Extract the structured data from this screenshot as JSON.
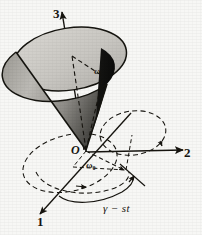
{
  "figure": {
    "background_color": "#f7f7f5",
    "ink_color": "#16140f"
  },
  "axes": [
    {
      "id": "axis-3",
      "label": "3",
      "direction": "up",
      "style": "solid-arrow"
    },
    {
      "id": "axis-2",
      "label": "2",
      "direction": "right",
      "style": "solid-arrow"
    },
    {
      "id": "axis-1",
      "label": "1",
      "direction": "down-left",
      "style": "solid-arrow"
    }
  ],
  "labels": {
    "origin": "O",
    "omega": "ω",
    "omega_zero_symbol": "ω",
    "omega_zero_subscript": "0",
    "angle_expression": "γ − st"
  },
  "cone": {
    "apex": "origin",
    "top_ellipse_fill": "#cfcdc8",
    "body_light_fill": "#a9a7a2",
    "body_dark_fill": "#1a1a1a",
    "outline_color": "#1a1a1a"
  },
  "curves": [
    {
      "id": "precession-circle-left",
      "style": "dashed",
      "has_arrow": true
    },
    {
      "id": "precession-circle-right",
      "style": "dashed",
      "has_arrow": true
    },
    {
      "id": "body-cone-base-circle",
      "style": "dashed",
      "has_arrow": true
    },
    {
      "id": "angle-arc",
      "style": "solid",
      "has_arrow": true
    }
  ],
  "vectors": [
    {
      "id": "omega-vector",
      "style": "dashed",
      "from": "origin",
      "to": "cone-top-rim"
    },
    {
      "id": "omega-zero-vector",
      "style": "dashed",
      "from": "origin",
      "to": "in-plane-point"
    }
  ]
}
